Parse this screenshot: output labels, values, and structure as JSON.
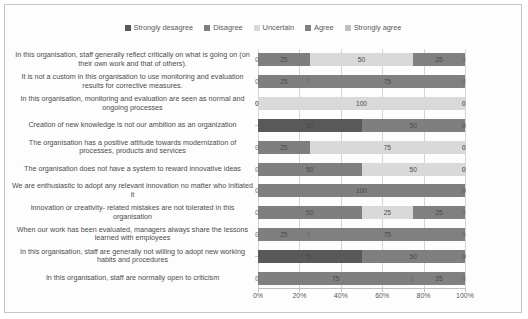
{
  "chart_data": {
    "type": "bar",
    "orientation": "horizontal",
    "stacked": true,
    "title": "",
    "xlabel": "",
    "ylabel": "",
    "xlim": [
      0,
      100
    ],
    "xticks": [
      "0%",
      "20%",
      "40%",
      "60%",
      "80%",
      "100%"
    ],
    "xtick_values": [
      0,
      20,
      40,
      60,
      80,
      100
    ],
    "grid": true,
    "legend_position": "top",
    "legend": [
      "Strongly desagree",
      "Disagree",
      "Uncertain",
      "Agree",
      "Strongly agree"
    ],
    "colors": [
      "#595959",
      "#7f7f7f",
      "#d9d9d9",
      "#808080",
      "#bfbfbf"
    ],
    "categories": [
      "In this organisation, staff generally reflect critically on what is going on (on their own work and that of others).",
      "It is not a custom in this organisation to use monitoring and evaluation results for corrective measures.",
      "In this organisation, monitoring and evaluation are seen as normal and ongoing processes",
      "Creation of new knowledge is not our ambition as an organization",
      "The organisation has a positive attitude towards modernization of processes, products and services",
      "The organisation does not have a system to reward innovative ideas",
      "We are enthusiastic to adopt any relevant innovation no matter who initiated it",
      "Innovation or creativity- related mistakes are not tolerated in this organisation",
      "When our work has been evaluated, managers always share the lessons learned with employees",
      "In this organisation, staff are generally not willing to adopt new working habits and procedures",
      "In this organisation, staff are normally open to criticism"
    ],
    "series": [
      {
        "name": "Strongly desagree",
        "values": [
          0,
          0,
          0,
          50,
          0,
          0,
          0,
          0,
          0,
          50,
          0
        ]
      },
      {
        "name": "Disagree",
        "values": [
          25,
          25,
          0,
          50,
          25,
          50,
          100,
          50,
          25,
          50,
          75
        ]
      },
      {
        "name": "Uncertain",
        "values": [
          50,
          0,
          100,
          0,
          75,
          50,
          0,
          25,
          0,
          0,
          0
        ]
      },
      {
        "name": "Agree",
        "values": [
          25,
          75,
          0,
          0,
          0,
          0,
          0,
          25,
          75,
          0,
          25
        ]
      },
      {
        "name": "Strongly agree",
        "values": [
          0,
          0,
          0,
          0,
          0,
          0,
          0,
          0,
          0,
          0,
          0
        ]
      }
    ],
    "data_labels": [
      [
        0,
        25,
        50,
        25,
        0
      ],
      [
        0,
        25,
        0,
        75,
        0
      ],
      [
        0,
        0,
        100,
        0,
        0
      ],
      [
        50,
        50,
        0,
        0,
        0
      ],
      [
        0,
        25,
        75,
        0,
        0
      ],
      [
        0,
        50,
        50,
        0,
        0
      ],
      [
        0,
        100,
        0,
        0,
        0
      ],
      [
        0,
        50,
        25,
        25,
        0
      ],
      [
        0,
        25,
        0,
        75,
        0
      ],
      [
        50,
        50,
        0,
        0,
        0
      ],
      [
        0,
        75,
        0,
        25,
        0
      ]
    ]
  }
}
